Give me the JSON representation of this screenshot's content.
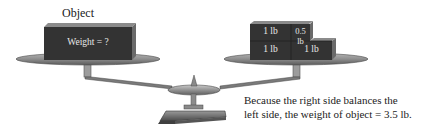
{
  "left_pan": {
    "label": "Object",
    "object_text": "Weight = ?"
  },
  "right_pan": {
    "blocks": [
      {
        "label": "1 lb"
      },
      {
        "label": "0.5 lb"
      },
      {
        "label": "1 lb"
      },
      {
        "label": "1 lb"
      }
    ]
  },
  "caption": {
    "line1": "Because the right side balances the",
    "line2": "left side, the weight of object = 3.5 lb."
  },
  "colors": {
    "block": "#333333",
    "pan": "#8a8a8a",
    "background": "#ffffff"
  }
}
